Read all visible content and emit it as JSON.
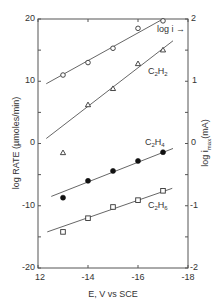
{
  "chart_data": {
    "type": "scatter",
    "title": "",
    "xlabel": "E, V vs SCE",
    "ylabel": "log RATE (µmoles/min)",
    "ylabel_right": "log i_max (mA)",
    "xlim": [
      -1.2,
      -1.8
    ],
    "ylim": [
      -2.0,
      2.0
    ],
    "ylim_right": [
      -2,
      2
    ],
    "x_ticks": [
      -1.2,
      -1.4,
      -1.6,
      -1.8
    ],
    "x_tick_labels": [
      "12",
      "-14",
      "-16",
      "-18"
    ],
    "y_ticks": [
      2.0,
      1.0,
      0,
      -1.0,
      -2.0
    ],
    "y_tick_labels": [
      "20",
      "10",
      "0",
      "-10",
      "-20"
    ],
    "y_minor_ticks": [
      1.5,
      0.5,
      -0.5,
      -1.5
    ],
    "y_right_ticks": [
      2,
      1,
      0,
      -1,
      -2
    ],
    "y_right_tick_labels": [
      "2",
      "1",
      "0",
      "-1",
      "-2"
    ],
    "grid": false,
    "x": [
      -1.3,
      -1.4,
      -1.5,
      -1.6,
      -1.7
    ],
    "series": [
      {
        "name": "log i",
        "label": "log i →",
        "marker": "open-circle",
        "axis": "right",
        "values": [
          1.1,
          1.3,
          1.53,
          1.85,
          1.97
        ],
        "fit_line": {
          "x": [
            -1.233,
            -1.7
          ],
          "y": [
            0.96,
            2.0
          ]
        }
      },
      {
        "name": "C2H2",
        "label": "C2H2",
        "marker": "open-triangle",
        "axis": "left",
        "values": [
          -0.15,
          0.62,
          0.88,
          1.28,
          1.5
        ],
        "fit_line": {
          "x": [
            -1.233,
            -1.74
          ],
          "y": [
            0.08,
            1.65
          ]
        }
      },
      {
        "name": "C2H4",
        "label": "C2H4",
        "marker": "filled-circle",
        "axis": "left",
        "values": [
          -0.87,
          -0.6,
          -0.44,
          -0.28,
          -0.14
        ],
        "fit_line": {
          "x": [
            -1.253,
            -1.74
          ],
          "y": [
            -0.85,
            -0.08
          ]
        }
      },
      {
        "name": "C2H6",
        "label": "C2H6",
        "marker": "open-square",
        "axis": "left",
        "values": [
          -1.42,
          -1.2,
          -1.02,
          -0.91,
          -0.76
        ],
        "fit_line": {
          "x": [
            -1.237,
            -1.737
          ],
          "y": [
            -1.42,
            -0.72
          ]
        }
      }
    ]
  },
  "labels": {
    "xlabel": "E, V vs SCE",
    "ylabel_left": "log RATE (µmoles/min)",
    "ylabel_right_prefix": "log i",
    "ylabel_right_sub": "max",
    "ylabel_right_suffix": "(mA)",
    "log_i": "log i →",
    "c2h2": {
      "base": "C",
      "sub1": "2",
      "mid": "H",
      "sub2": "2"
    },
    "c2h4": {
      "base": "C",
      "sub1": "2",
      "mid": "H",
      "sub2": "4"
    },
    "c2h6": {
      "base": "C",
      "sub1": "2",
      "mid": "H",
      "sub2": "6"
    },
    "y_ticks_left": [
      "20",
      "10",
      "0",
      "-10",
      "-20"
    ],
    "y_ticks_right": [
      "2",
      "1",
      "0",
      "-1",
      "-2"
    ],
    "x_ticks": [
      "12",
      "-14",
      "-16",
      "-18"
    ]
  },
  "colors": {
    "axis": "#555555",
    "line": "#555555",
    "marker": "#333333",
    "text": "#333333"
  }
}
